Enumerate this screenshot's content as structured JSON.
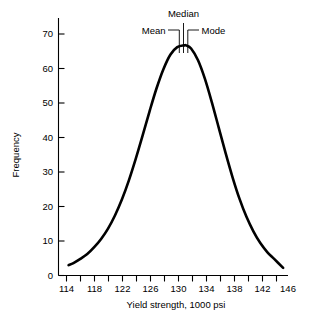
{
  "chart_data": {
    "type": "line",
    "title": "",
    "subtitle": "",
    "xlabel": "Yield strength, 1000 psi",
    "ylabel": "Frequency",
    "xlim": [
      113,
      147
    ],
    "ylim": [
      0,
      73
    ],
    "grid": false,
    "legend": "none",
    "x_ticks_major": [
      114,
      118,
      122,
      126,
      130,
      134,
      138,
      142,
      146
    ],
    "x_ticks_minor": [
      116,
      120,
      124,
      128,
      132,
      136,
      140,
      144
    ],
    "x_tick_labels": [
      "114",
      "118",
      "122",
      "126",
      "130",
      "134",
      "138",
      "142",
      "146"
    ],
    "y_ticks": [
      0,
      10,
      20,
      30,
      40,
      50,
      60,
      70
    ],
    "y_tick_labels": [
      "0",
      "10",
      "20",
      "30",
      "40",
      "50",
      "60",
      "70"
    ],
    "series": [
      {
        "name": "Frequency distribution of yield strength",
        "shape": "bell-curve",
        "x": [
          114.3,
          115,
          116,
          117,
          118,
          119,
          120,
          121,
          122,
          123,
          124,
          125,
          126,
          127,
          128,
          129,
          130,
          131,
          131.3,
          132,
          133,
          134,
          135,
          136,
          137,
          138,
          139,
          140,
          141,
          142,
          143,
          144,
          145.3
        ],
        "values": [
          3.0,
          3.6,
          4.8,
          6.2,
          8.2,
          10.6,
          13.6,
          17.4,
          22.0,
          27.5,
          33.8,
          40.6,
          47.6,
          54.2,
          59.8,
          64.0,
          66.2,
          66.7,
          66.7,
          65.8,
          62.4,
          57.0,
          50.2,
          42.8,
          35.4,
          28.4,
          22.2,
          17.0,
          12.8,
          9.4,
          6.8,
          4.8,
          2.2
        ]
      }
    ],
    "annotations": [
      {
        "label": "Mean",
        "x": 130.1,
        "value": 66.0,
        "leader": "elbow-right"
      },
      {
        "label": "Median",
        "x": 130.7,
        "value": 66.4,
        "leader": "straight-down"
      },
      {
        "label": "Mode",
        "x": 131.3,
        "value": 66.7,
        "leader": "elbow-left"
      }
    ]
  },
  "colors": {
    "curve": "#000000",
    "axis": "#000000",
    "text": "#000000",
    "background": "#ffffff"
  }
}
